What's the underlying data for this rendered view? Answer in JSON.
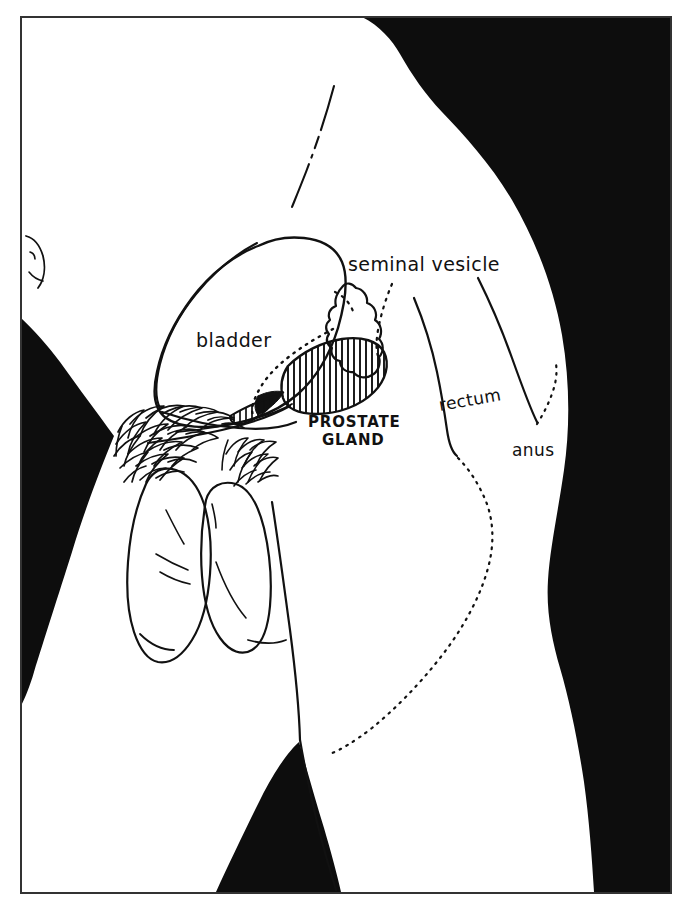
{
  "figure": {
    "kind": "anatomical-line-diagram",
    "view": "male pelvis, sagittal side view",
    "background_color": "#ffffff",
    "ink_color": "#111111",
    "silhouette_color": "#0d0d0d",
    "frame": {
      "x": 20,
      "y": 16,
      "width": 652,
      "height": 878,
      "stroke": "#333333",
      "stroke_width": 2
    }
  },
  "labels": {
    "bladder": {
      "text": "bladder",
      "x": 196,
      "y": 347,
      "size": 19,
      "style": "handwritten-lower"
    },
    "seminal_vesicle": {
      "text": "seminal vesicle",
      "x": 348,
      "y": 271,
      "size": 19,
      "style": "handwritten-lower"
    },
    "prostate_gland_line1": {
      "text": "PROSTATE",
      "x": 308,
      "y": 427,
      "size": 15,
      "style": "handwritten-caps"
    },
    "prostate_gland_line2": {
      "text": "GLAND",
      "x": 322,
      "y": 445,
      "size": 15,
      "style": "handwritten-caps"
    },
    "rectum": {
      "text": "rectum",
      "x": 440,
      "y": 411,
      "size": 17,
      "style": "handwritten-lower"
    },
    "anus": {
      "text": "anus",
      "x": 512,
      "y": 456,
      "size": 17,
      "style": "handwritten-lower"
    }
  },
  "structures": [
    {
      "name": "bladder",
      "fill": "none",
      "note": "large rounded organ, outlined only"
    },
    {
      "name": "seminal-vesicle",
      "fill": "none",
      "note": "lobulated sac behind bladder"
    },
    {
      "name": "prostate-gland",
      "fill": "vertical-hatch",
      "note": "hatched ovoid below bladder"
    },
    {
      "name": "rectum",
      "fill": "none",
      "note": "curved tube behind prostate"
    },
    {
      "name": "anus",
      "fill": "none",
      "note": "dotted terminal opening"
    },
    {
      "name": "penis",
      "fill": "none",
      "note": "outlined shaft, lower left"
    },
    {
      "name": "scrotum",
      "fill": "none",
      "note": "outlined sac beside penis"
    },
    {
      "name": "pubic-hair",
      "fill": "scribble",
      "note": "dense squiggle mass above genitals"
    },
    {
      "name": "body-silhouette",
      "fill": "solid-black",
      "note": "black regions: upper-right back/buttock, left wedge, bottom wedge"
    }
  ],
  "leader_lines": [
    {
      "from": "seminal_vesicle",
      "style": "dotted"
    },
    {
      "from": "bladder-neck",
      "style": "dotted"
    },
    {
      "from": "anus",
      "style": "dotted"
    }
  ]
}
